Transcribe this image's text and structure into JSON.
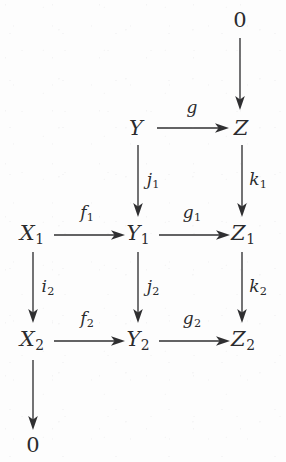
{
  "diagram": {
    "kind": "commutative-diagram",
    "background_color": "#fdfdfd",
    "ink_color": "#2b2b2d",
    "objects": [
      {
        "id": "zero_top",
        "label": "0",
        "sub": "",
        "x": 240,
        "y": 20,
        "style": "upright"
      },
      {
        "id": "Y",
        "label": "Y",
        "sub": "",
        "x": 136,
        "y": 128,
        "style": "italic"
      },
      {
        "id": "Z",
        "label": "Z",
        "sub": "",
        "x": 241,
        "y": 128,
        "style": "italic"
      },
      {
        "id": "X1",
        "label": "X",
        "sub": "1",
        "x": 32,
        "y": 235,
        "style": "italic"
      },
      {
        "id": "Y1",
        "label": "Y",
        "sub": "1",
        "x": 138,
        "y": 235,
        "style": "italic"
      },
      {
        "id": "Z1",
        "label": "Z",
        "sub": "1",
        "x": 243,
        "y": 235,
        "style": "italic"
      },
      {
        "id": "X2",
        "label": "X",
        "sub": "2",
        "x": 32,
        "y": 341,
        "style": "italic"
      },
      {
        "id": "Y2",
        "label": "Y",
        "sub": "2",
        "x": 138,
        "y": 341,
        "style": "italic"
      },
      {
        "id": "Z2",
        "label": "Z",
        "sub": "2",
        "x": 243,
        "y": 341,
        "style": "italic"
      },
      {
        "id": "zero_bottom",
        "label": "0",
        "sub": "",
        "x": 33,
        "y": 445,
        "style": "upright"
      }
    ],
    "morphisms": [
      {
        "id": "zero_to_Z",
        "label": "",
        "sub": "",
        "direction": "down",
        "from": "zero_top",
        "to": "Z",
        "label_x": 0,
        "label_y": 0
      },
      {
        "id": "g",
        "label": "g",
        "sub": "",
        "direction": "right",
        "from": "Y",
        "to": "Z",
        "label_x": 192,
        "label_y": 107
      },
      {
        "id": "j1",
        "label": "j",
        "sub": "1",
        "direction": "down",
        "from": "Y",
        "to": "Y1",
        "label_x": 153,
        "label_y": 181
      },
      {
        "id": "k1",
        "label": "k",
        "sub": "1",
        "direction": "down",
        "from": "Z",
        "to": "Z1",
        "label_x": 258,
        "label_y": 181
      },
      {
        "id": "f1",
        "label": "f",
        "sub": "1",
        "direction": "right",
        "from": "X1",
        "to": "Y1",
        "label_x": 87,
        "label_y": 214
      },
      {
        "id": "g1",
        "label": "g",
        "sub": "1",
        "direction": "right",
        "from": "Y1",
        "to": "Z1",
        "label_x": 192,
        "label_y": 214
      },
      {
        "id": "i2",
        "label": "i",
        "sub": "2",
        "direction": "down",
        "from": "X1",
        "to": "X2",
        "label_x": 48,
        "label_y": 288
      },
      {
        "id": "j2",
        "label": "j",
        "sub": "2",
        "direction": "down",
        "from": "Y1",
        "to": "Y2",
        "label_x": 153,
        "label_y": 288
      },
      {
        "id": "k2",
        "label": "k",
        "sub": "2",
        "direction": "down",
        "from": "Z1",
        "to": "Z2",
        "label_x": 258,
        "label_y": 288
      },
      {
        "id": "f2",
        "label": "f",
        "sub": "2",
        "direction": "right",
        "from": "X2",
        "to": "Y2",
        "label_x": 87,
        "label_y": 320
      },
      {
        "id": "g2",
        "label": "g",
        "sub": "2",
        "direction": "right",
        "from": "Y2",
        "to": "Z2",
        "label_x": 192,
        "label_y": 320
      },
      {
        "id": "X2_to_zero",
        "label": "",
        "sub": "",
        "direction": "down",
        "from": "X2",
        "to": "zero_bottom",
        "label_x": 0,
        "label_y": 0
      }
    ]
  }
}
